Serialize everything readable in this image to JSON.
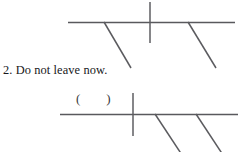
{
  "page": {
    "background_color": "#ffffff",
    "width": 248,
    "height": 152,
    "ink_color": "#59595d",
    "text_color": "#17171a"
  },
  "exercise": {
    "number": "2.",
    "sentence": "Do not leave now.",
    "full_line": "2.  Do not leave now."
  },
  "annotation": {
    "parentheses": "(        )"
  },
  "diagrams": [
    {
      "id": "upper-intonation-staff",
      "name": "intonation-diagram-top",
      "baseline": {
        "x1": 68,
        "y1": 22.5,
        "x2": 235,
        "y2": 22.5
      },
      "vertical_stress_bar": {
        "x1": 150,
        "y1": 2,
        "x2": 150,
        "y2": 43
      },
      "falling_tone_strokes": [
        {
          "x1": 104,
          "y1": 22,
          "x2": 131,
          "y2": 68
        },
        {
          "x1": 188,
          "y1": 22,
          "x2": 216,
          "y2": 68
        }
      ]
    },
    {
      "id": "lower-intonation-staff",
      "name": "intonation-diagram-bottom",
      "baseline": {
        "x1": 60,
        "y1": 114.5,
        "x2": 238,
        "y2": 114.5
      },
      "vertical_stress_bar": {
        "x1": 133,
        "y1": 93,
        "x2": 133,
        "y2": 136
      },
      "falling_tone_strokes": [
        {
          "x1": 155,
          "y1": 114,
          "x2": 184,
          "y2": 158
        },
        {
          "x1": 196,
          "y1": 114,
          "x2": 225,
          "y2": 158
        }
      ]
    }
  ],
  "stroke_widths": {
    "baseline": 1.6,
    "vertical": 1.5,
    "diagonal": 1.5
  }
}
